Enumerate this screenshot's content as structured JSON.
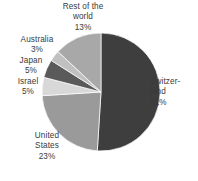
{
  "chart_data": {
    "type": "pie",
    "title": "",
    "subtitle": "",
    "xlabel": "",
    "ylabel": "",
    "grid": false,
    "legend_position": "none",
    "label_format": "name + percent",
    "start_angle_deg": 0,
    "direction": "clockwise",
    "categories": [
      "Switzerland",
      "United States",
      "Israel",
      "Japan",
      "Australia",
      "Rest of the world"
    ],
    "values": [
      51,
      23,
      5,
      5,
      3,
      13
    ],
    "units": "%",
    "colors": [
      "#3e3e3e",
      "#9a9a9a",
      "#d8d8d8",
      "#5a5a5a",
      "#c0c0c0",
      "#a8a8a8"
    ],
    "slices": [
      {
        "name": "Switzerland",
        "value": 51,
        "color": "#3e3e3e"
      },
      {
        "name": "United States",
        "value": 23,
        "color": "#9a9a9a"
      },
      {
        "name": "Israel",
        "value": 5,
        "color": "#d8d8d8"
      },
      {
        "name": "Japan",
        "value": 5,
        "color": "#5a5a5a"
      },
      {
        "name": "Australia",
        "value": 3,
        "color": "#c0c0c0"
      },
      {
        "name": "Rest of the world",
        "value": 13,
        "color": "#a8a8a8"
      }
    ]
  },
  "labels": {
    "rest_of_world": "Rest of the\nworld\n13%",
    "australia": "Australia\n3%",
    "japan": "Japan\n5%",
    "israel": "Israel\n5%",
    "united_states": "United\nStates\n23%",
    "switzerland": "Switzer-\nland\n51%"
  },
  "geometry": {
    "center_x": 101,
    "center_y": 92,
    "radius": 59
  }
}
